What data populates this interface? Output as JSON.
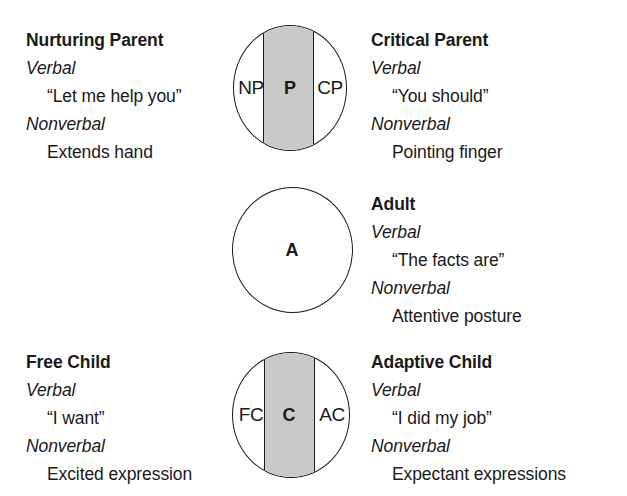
{
  "diagram": {
    "colors": {
      "background": "#ffffff",
      "ink": "#1a1a1a",
      "band_fill": "#c9c9c9"
    },
    "channel_labels": {
      "verbal": "Verbal",
      "nonverbal": "Nonverbal"
    },
    "rows": [
      {
        "id": "parent",
        "circle": {
          "center_letter": "P",
          "left_letter": "NP",
          "right_letter": "CP",
          "has_band": true
        },
        "left": {
          "title": "Nurturing Parent",
          "verbal_label": "Verbal",
          "verbal": "“Let me help you”",
          "nonverbal_label": "Nonverbal",
          "nonverbal": "Extends hand"
        },
        "right": {
          "title": "Critical Parent",
          "verbal_label": "Verbal",
          "verbal": "“You should”",
          "nonverbal_label": "Nonverbal",
          "nonverbal": "Pointing finger"
        }
      },
      {
        "id": "adult",
        "circle": {
          "center_letter": "A",
          "left_letter": "",
          "right_letter": "",
          "has_band": false
        },
        "left": null,
        "right": {
          "title": "Adult",
          "verbal_label": "Verbal",
          "verbal": "“The facts are”",
          "nonverbal_label": "Nonverbal",
          "nonverbal": "Attentive posture"
        }
      },
      {
        "id": "child",
        "circle": {
          "center_letter": "C",
          "left_letter": "FC",
          "right_letter": "AC",
          "has_band": true
        },
        "left": {
          "title": "Free Child",
          "verbal_label": "Verbal",
          "verbal": "“I want”",
          "nonverbal_label": "Nonverbal",
          "nonverbal": "Excited expression"
        },
        "right": {
          "title": "Adaptive Child",
          "verbal_label": "Verbal",
          "verbal": "“I did my job”",
          "nonverbal_label": "Nonverbal",
          "nonverbal": "Expectant expressions"
        }
      }
    ]
  }
}
